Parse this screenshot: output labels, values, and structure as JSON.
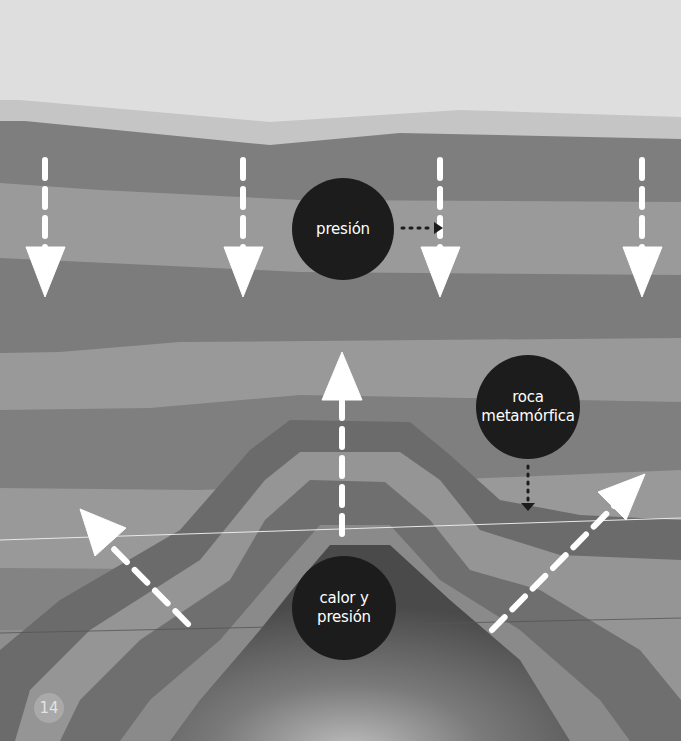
{
  "diagram": {
    "labels": {
      "pressure": "presión",
      "metamorphic_rock_line1": "roca",
      "metamorphic_rock_line2": "metamórfica",
      "heat_pressure_line1": "calor y",
      "heat_pressure_line2": "presión"
    },
    "arrows": {
      "down_pressure_count": 4,
      "up_heat_count": 3
    },
    "colors": {
      "sky": "#dedede",
      "layer_light": "#c6c6c6",
      "layer_dark": "#7d7d7d",
      "layer_mid": "#9b9b9b",
      "bubble": "#1c1c1c",
      "arrow": "#ffffff"
    }
  },
  "page": {
    "number": "14"
  }
}
